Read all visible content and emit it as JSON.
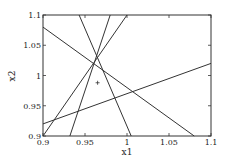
{
  "chart_data": {
    "type": "line",
    "title": "",
    "xlabel": "x1",
    "ylabel": "x2",
    "xlim": [
      0.9,
      1.1
    ],
    "ylim": [
      0.9,
      1.1
    ],
    "grid": false,
    "legend": null,
    "xticks": [
      0.9,
      0.95,
      1,
      1.05,
      1.1
    ],
    "xtick_labels": [
      "0.9",
      "0.95",
      "1",
      "1.05",
      "1.1"
    ],
    "yticks": [
      0.9,
      0.95,
      1,
      1.05,
      1.1
    ],
    "ytick_labels": [
      "0.9",
      "0.95",
      "1",
      "1.05",
      "1.1"
    ],
    "series": [
      {
        "name": "line-1",
        "x": [
          0.9,
          1.08
        ],
        "y": [
          1.08,
          0.9
        ]
      },
      {
        "name": "line-2",
        "x": [
          0.9,
          1.1
        ],
        "y": [
          0.92,
          1.02
        ]
      },
      {
        "name": "line-3",
        "x": [
          0.9,
          1.0
        ],
        "y": [
          0.9,
          1.1
        ]
      },
      {
        "name": "line-4",
        "x": [
          0.932,
          0.98
        ],
        "y": [
          0.9,
          1.1
        ]
      },
      {
        "name": "line-5",
        "x": [
          0.943,
          1.005
        ],
        "y": [
          1.1,
          0.9
        ]
      }
    ],
    "markers": [
      {
        "name": "point",
        "symbol": "+",
        "x": 0.965,
        "y": 0.988
      }
    ],
    "colors": {
      "line": "#333333",
      "axes": "#333333",
      "background": "#ffffff"
    }
  }
}
